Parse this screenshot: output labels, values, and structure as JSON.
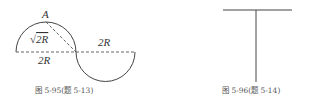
{
  "figure_left": {
    "caption": "图   5-95(题 5-13)",
    "labels": {
      "point_a": "A",
      "chord": "√2R",
      "chord_sqrt": "√",
      "chord_rest": "2R",
      "upper_diameter": "2R",
      "lower_diameter": "2R"
    }
  },
  "figure_right": {
    "caption": "图 5-96(题 5-14)"
  },
  "colors": {
    "line": "#444444",
    "dashed": "#555555",
    "caption": "#555555"
  }
}
